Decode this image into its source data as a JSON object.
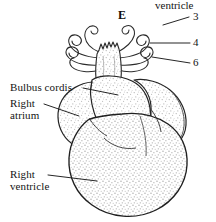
{
  "figure": {
    "panel_letter": "E",
    "top_partial_label": "ventricle",
    "background_color": "#ffffff",
    "ink_color": "#1a1a1a",
    "stipple_color": "#b9b9b9"
  },
  "labels": {
    "bulbus_cordis": "Bulbus cordis",
    "right_atrium_line1": "Right",
    "right_atrium_line2": "atrium",
    "right_ventricle_line1": "Right",
    "right_ventricle_line2": "ventricle"
  },
  "arch_numbers": [
    {
      "id": "arch-3",
      "text": "3"
    },
    {
      "id": "arch-4",
      "text": "4"
    },
    {
      "id": "arch-6",
      "text": "6"
    }
  ]
}
